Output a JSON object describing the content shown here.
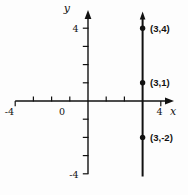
{
  "figure": {
    "y_axis_label": "y",
    "x_axis_label": "x",
    "origin_label": "0",
    "x_axis_min_label": "-4",
    "x_axis_max_label": "4",
    "y_axis_max_label": "4",
    "y_axis_min_label": "-4"
  },
  "chart_data": {
    "type": "line",
    "title": "",
    "xlabel": "x",
    "ylabel": "y",
    "xlim": [
      -4,
      4
    ],
    "ylim": [
      -4,
      4
    ],
    "grid": false,
    "legend": false,
    "x_labeled_ticks": [
      -4,
      0,
      4
    ],
    "y_labeled_ticks": [
      -4,
      4
    ],
    "x_minor_ticks": [
      -3,
      -2,
      -1,
      1,
      2
    ],
    "y_minor_ticks": [
      1,
      2,
      3,
      -1,
      -2,
      -3
    ],
    "x_edge_ticks": [
      -4,
      4
    ],
    "y_edge_ticks": [
      4,
      -4
    ],
    "series": [
      {
        "name": "vertical line",
        "equation": "x = 3",
        "x": 3
      }
    ],
    "points": [
      {
        "x": 3,
        "y": 4,
        "label": "(3,4)"
      },
      {
        "x": 3,
        "y": 1,
        "label": "(3,1)"
      },
      {
        "x": 3,
        "y": -2,
        "label": "(3,-2)"
      }
    ]
  }
}
